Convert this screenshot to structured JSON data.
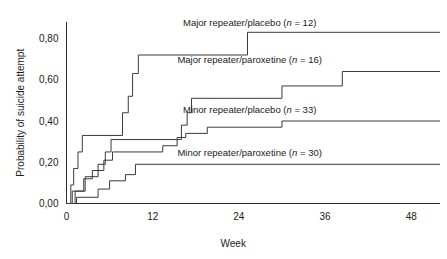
{
  "chart_data": {
    "type": "line",
    "subtype": "kaplan-meier-step",
    "title": "",
    "xlabel": "Week",
    "ylabel": "Probability of suicide attempt",
    "xlim": [
      0,
      52
    ],
    "ylim": [
      0.0,
      0.88
    ],
    "grid": false,
    "legend_position": "inline-right-above-each-curve",
    "decimal_separator": ",",
    "xticks": [
      0,
      12,
      24,
      36,
      48
    ],
    "xtick_labels": [
      "0",
      "12",
      "24",
      "36",
      "48"
    ],
    "yticks": [
      0.0,
      0.2,
      0.4,
      0.6,
      0.8
    ],
    "ytick_labels": [
      "0,00",
      "0,20",
      "0,40",
      "0,60",
      "0,80"
    ],
    "series": [
      {
        "name": "Major repeater/placebo",
        "group": "Major repeater",
        "treatment": "placebo",
        "n": 12,
        "label": "Major repeater/placebo (n = 12)",
        "final_value": 0.83,
        "color": "#3a3a3a",
        "steps": [
          [
            0.0,
            0.0
          ],
          [
            0.6,
            0.0
          ],
          [
            0.6,
            0.09
          ],
          [
            1.0,
            0.09
          ],
          [
            1.0,
            0.17
          ],
          [
            1.6,
            0.17
          ],
          [
            1.6,
            0.25
          ],
          [
            2.2,
            0.25
          ],
          [
            2.2,
            0.33
          ],
          [
            7.8,
            0.33
          ],
          [
            7.8,
            0.44
          ],
          [
            8.6,
            0.44
          ],
          [
            8.6,
            0.52
          ],
          [
            9.2,
            0.52
          ],
          [
            9.2,
            0.63
          ],
          [
            10.0,
            0.63
          ],
          [
            10.0,
            0.72
          ],
          [
            25.2,
            0.72
          ],
          [
            25.2,
            0.83
          ],
          [
            52.0,
            0.83
          ]
        ]
      },
      {
        "name": "Major repeater/paroxetine",
        "group": "Major repeater",
        "treatment": "paroxetine",
        "n": 16,
        "label": "Major repeater/paroxetine (n = 16)",
        "final_value": 0.64,
        "color": "#3a3a3a",
        "steps": [
          [
            0.0,
            0.0
          ],
          [
            0.8,
            0.0
          ],
          [
            0.8,
            0.06
          ],
          [
            2.6,
            0.06
          ],
          [
            2.6,
            0.13
          ],
          [
            4.4,
            0.13
          ],
          [
            4.4,
            0.19
          ],
          [
            5.4,
            0.19
          ],
          [
            5.4,
            0.25
          ],
          [
            6.2,
            0.25
          ],
          [
            6.2,
            0.31
          ],
          [
            16.0,
            0.31
          ],
          [
            16.0,
            0.38
          ],
          [
            16.8,
            0.38
          ],
          [
            16.8,
            0.44
          ],
          [
            17.4,
            0.44
          ],
          [
            17.4,
            0.51
          ],
          [
            30.0,
            0.51
          ],
          [
            30.0,
            0.57
          ],
          [
            38.4,
            0.57
          ],
          [
            38.4,
            0.64
          ],
          [
            52.0,
            0.64
          ]
        ]
      },
      {
        "name": "Minor repeater/placebo",
        "group": "Minor repeater",
        "treatment": "placebo",
        "n": 33,
        "label": "Minor repeater/placebo (n = 33)",
        "final_value": 0.4,
        "color": "#3a3a3a",
        "steps": [
          [
            0.0,
            0.0
          ],
          [
            1.2,
            0.0
          ],
          [
            1.2,
            0.06
          ],
          [
            2.4,
            0.06
          ],
          [
            2.4,
            0.12
          ],
          [
            3.6,
            0.12
          ],
          [
            3.6,
            0.16
          ],
          [
            5.2,
            0.16
          ],
          [
            5.2,
            0.21
          ],
          [
            6.4,
            0.21
          ],
          [
            6.4,
            0.25
          ],
          [
            13.4,
            0.25
          ],
          [
            13.4,
            0.28
          ],
          [
            15.4,
            0.28
          ],
          [
            15.4,
            0.32
          ],
          [
            16.6,
            0.32
          ],
          [
            16.6,
            0.34
          ],
          [
            19.6,
            0.34
          ],
          [
            19.6,
            0.37
          ],
          [
            30.0,
            0.37
          ],
          [
            30.0,
            0.4
          ],
          [
            52.0,
            0.4
          ]
        ]
      },
      {
        "name": "Minor repeater/paroxetine",
        "group": "Minor repeater",
        "treatment": "paroxetine",
        "n": 30,
        "label": "Minor repeater/paroxetine (n = 30)",
        "final_value": 0.19,
        "color": "#3a3a3a",
        "steps": [
          [
            0.0,
            0.0
          ],
          [
            1.4,
            0.0
          ],
          [
            1.4,
            0.03
          ],
          [
            4.4,
            0.03
          ],
          [
            4.4,
            0.07
          ],
          [
            6.0,
            0.07
          ],
          [
            6.0,
            0.11
          ],
          [
            8.2,
            0.11
          ],
          [
            8.2,
            0.14
          ],
          [
            9.6,
            0.14
          ],
          [
            9.6,
            0.19
          ],
          [
            52.0,
            0.19
          ]
        ]
      }
    ],
    "annotations": [
      {
        "text": "Major repeater/placebo (n = 12)",
        "anchor_x": 25.5,
        "anchor_y": 0.86
      },
      {
        "text": "Major repeater/paroxetine (n = 16)",
        "anchor_x": 25.5,
        "anchor_y": 0.68
      },
      {
        "text": "Minor repeater/placebo (n = 33)",
        "anchor_x": 25.5,
        "anchor_y": 0.44
      },
      {
        "text": "Minor repeater/paroxetine (n = 30)",
        "anchor_x": 25.5,
        "anchor_y": 0.23
      }
    ]
  },
  "legend_parts": [
    {
      "prefix": "Major repeater/placebo (",
      "ital": "n",
      "suffix": " = 12)"
    },
    {
      "prefix": "Major repeater/paroxetine (",
      "ital": "n",
      "suffix": " = 16)"
    },
    {
      "prefix": "Minor repeater/placebo (",
      "ital": "n",
      "suffix": " = 33)"
    },
    {
      "prefix": "Minor repeater/paroxetine (",
      "ital": "n",
      "suffix": " = 30)"
    }
  ]
}
